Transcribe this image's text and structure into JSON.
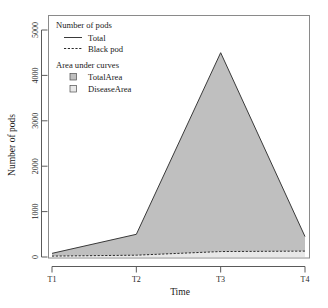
{
  "chart_data": {
    "type": "area",
    "title": "",
    "xlabel": "Time",
    "ylabel": "Number of pods",
    "categories": [
      "T1",
      "T2",
      "T3",
      "T4"
    ],
    "x": [
      1,
      2,
      3,
      4
    ],
    "xlim": [
      1,
      4
    ],
    "ylim": [
      0,
      5200
    ],
    "yticks": [
      0,
      1000,
      2000,
      3000,
      4000,
      5000
    ],
    "yticklabels": [
      "0",
      "1000",
      "2000",
      "3000",
      "4000",
      "5000"
    ],
    "xticklabels": [
      "T1",
      "T2",
      "T3",
      "T4"
    ],
    "grid": false,
    "legend_position": "top-left",
    "series": [
      {
        "name": "Total",
        "style": "solid",
        "color": "#3a3a3a",
        "values": [
          80,
          500,
          4500,
          450
        ]
      },
      {
        "name": "Black pod",
        "style": "dashed",
        "color": "#2b2b2b",
        "values": [
          20,
          40,
          120,
          130
        ]
      }
    ],
    "areas": [
      {
        "name": "TotalArea",
        "fill": "#bfbfbf",
        "under_series": "Total",
        "values": [
          80,
          500,
          4500,
          450
        ]
      },
      {
        "name": "DiseaseArea",
        "fill": "#e8e8e8",
        "under_series": "Black pod",
        "values": [
          20,
          40,
          120,
          130
        ]
      }
    ]
  },
  "legend": {
    "group_pods_title": "Number of pods",
    "group_area_title": "Area under curves",
    "items_pods": [
      {
        "label": "Total",
        "style": "solid"
      },
      {
        "label": "Black pod",
        "style": "dashed"
      }
    ],
    "items_area": [
      {
        "label": "TotalArea",
        "swatch": "#bfbfbf"
      },
      {
        "label": "DiseaseArea",
        "swatch": "#e8e8e8"
      }
    ]
  },
  "colors": {
    "total_area_fill": "#bfbfbf",
    "disease_area_fill": "#e8e8e8",
    "line": "#3a3a3a",
    "axis": "#5a5a5a",
    "frame": "#8a8a8a",
    "background": "#ffffff"
  }
}
